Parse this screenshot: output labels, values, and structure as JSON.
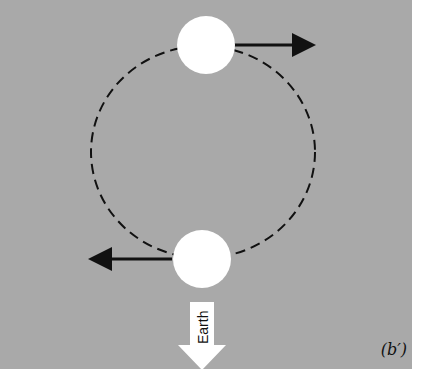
{
  "figure": {
    "label": "(b′)",
    "panel_color": "#a9a9a9",
    "orbit": {
      "cx": 203,
      "cy": 152,
      "rx": 112,
      "ry": 106,
      "style": "dashed"
    },
    "moons": [
      {
        "name": "moon-top",
        "cx": 206,
        "cy": 45,
        "r": 29,
        "velocity": "right"
      },
      {
        "name": "moon-bottom",
        "cx": 202,
        "cy": 259,
        "r": 29,
        "velocity": "left"
      }
    ],
    "earth_arrow": {
      "text": "Earth",
      "direction": "down"
    }
  }
}
